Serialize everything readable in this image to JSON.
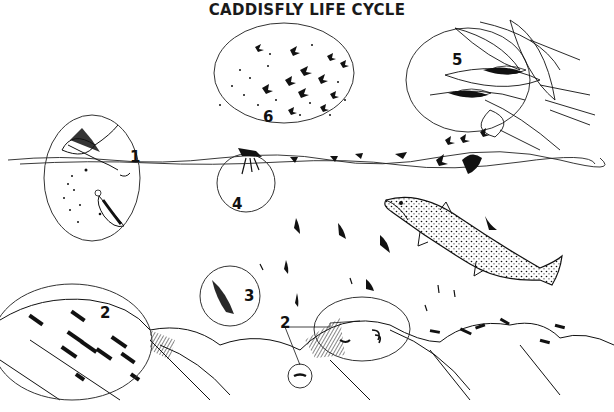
{
  "title": "CADDISFLY LIFE CYCLE",
  "stages": [
    {
      "id": "1",
      "label": "1",
      "description": "adult female laying eggs at water surface"
    },
    {
      "id": "2",
      "label": "2",
      "description": "larvae in cases on stream-bottom rocks"
    },
    {
      "id": "3",
      "label": "3",
      "description": "pupa ascending"
    },
    {
      "id": "4",
      "label": "4",
      "description": "emerging adult at surface"
    },
    {
      "id": "5",
      "label": "5",
      "description": "adults resting on vegetation"
    },
    {
      "id": "6",
      "label": "6",
      "description": "mating swarm"
    }
  ],
  "colors": {
    "ink": "#111111",
    "background": "#ffffff",
    "circle": "#333333"
  }
}
